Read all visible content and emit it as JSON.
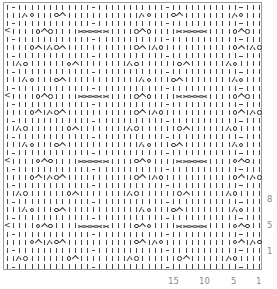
{
  "chart": {
    "title": "",
    "legend": {
      "k": "knit",
      "p": "purl",
      "o": "yarn over",
      "l": "left-leaning decrease",
      "a": "double decrease",
      "c": "cable cross",
      "e": "edge arrow",
      "b": "blank"
    },
    "columns": 42,
    "rows": [
      "kpkkkkkkkkkkkkpkkkkkkkkkkkpkkkkkkkkkkkpkkk",
      "kkklokkkoakkkkkkkkkkkklokkkoakkkkkkkklokkk",
      "kpkkkkkkkkkkkkpkkkkkkkkkkkpkkkkkkkkkkkpkkk",
      "ekkkkoaokkkkccccckkkkoaokkkkccccckkkkoaokk",
      "kpkkkkkkkkkkkkpkkkkkkkkkkkpkkkkkkkkkkkpkkk",
      "kkkkoakloakkkkkkkkkkkoaklokkkkkkkkkkkoaklo",
      "kpkkkkkkkkkkkkpkkkkkkkkkkkpkkkkkkkkkkkpkkk",
      "kklokkkkkkoakkkkkkkklokkkkkkoakkkkkklokkkk",
      "kpkkkkkkkkkkkkpkkkkkkkkkkkpkkkkkkkkkkkpkkk",
      "kkklokkkoakkkkkkkkkkkklokkkoakkkkkkkklokkk",
      "kpkkkkkkkkkkkkpkkkkkkkkkkkpkkkkkkkkkkkpkkk",
      "ekkkkoaokkkkccccckkkkoaokkkkccccckkkkoaokk",
      "kpkkkkkkkkkkkkpkkkkkkkkkkkpkkkkkkkkkkkpkkk",
      "kkkkoakloakkkkkkkkkkkoaklokkkkkkkkkkkoaklo",
      "kpkkkkkkkkkkkkpkkkkkkkkkkkpkkkkkkkkkkkpkkk",
      "kklokkkkkkoakkkkkkkklokkkkkkoakkkkkklokkkk",
      "kpkkkkkkkkkkkkpkkkkkkkkkkkpkkkkkkkkkkkpkkk",
      "kkklokkkoakkkkkkkkkkkklokkkoakkkkkkkklokkk",
      "kpkkkkkkkkkkkkpkkkkkkkkkkkpkkkkkkkkkkkpkkk",
      "ekkkkoaokkkkccccckkkkoaokkkkccccckkkkoaokk",
      "kpkkkkkkkkkkkkpkkkkkkkkkkkpkkkkkkkkkkkpkkk",
      "kkkkoakloakkkkkkkkkkkoaklokkkkkkkkkkkoaklo",
      "kpkkkkkkkkkkkkpkkkkkkkkkkkpkkkkkkkkkkkpkkk",
      "kklokkkkkkoakkkkkkkklokkkkkkoakkkkkklokkkk",
      "kpkkkkkkkkkkkkpkkkkkkkkkkkpkkkkkkkkkkkpkkk",
      "kkklokkkoakkkkkkkkkkkklokkkoakkkkkkkklokkk",
      "kpkkkkkkkkkkkkpkkkkkkkkkkkpkkkkkkkkkkkpkkk",
      "ekkkkoaokkkkccccckkkkoaokkkkccccckkkkoaokk",
      "kpkkkkkkkkkkkkpkkkkkkkkkkkpkkkkkkkkkkkpkkk",
      "kkkkoakloakkkkkkkkkkkoaklokkkkkkkkkkkoaklo",
      "kpkkkkkkkkkkkkpkkkkkkkkkkkpkkkkkkkkkkkpkkk",
      "kklokkkkkkoakkkkkkkklokkkkkkoakkkkkklokkkk",
      "kpkkkkkkkkkkkkpkkkkkkkkkkkpkkkkkkkkkkkpkkk"
    ],
    "row_labels": [
      {
        "text": "8",
        "top": 194
      },
      {
        "text": "5",
        "top": 220
      },
      {
        "text": "1",
        "top": 246
      }
    ],
    "column_labels": [
      {
        "text": "15",
        "left": 168
      },
      {
        "text": "10",
        "left": 199
      },
      {
        "text": "5",
        "left": 231
      },
      {
        "text": "1",
        "left": 256
      }
    ]
  }
}
